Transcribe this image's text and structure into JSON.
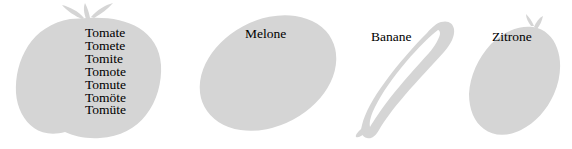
{
  "page": {
    "background_color": "#ffffff",
    "shape_fill_color": "#d5d5d5",
    "text_color": "#000000"
  },
  "figure": {
    "items": [
      {
        "id": "tomato",
        "icon": "tomato-shape",
        "label": "Tomate",
        "word_list": [
          "Tomate",
          "Tomete",
          "Tomite",
          "Tomote",
          "Tomute",
          "Tomöte",
          "Tomüte"
        ]
      },
      {
        "id": "melon",
        "icon": "melon-shape",
        "label": "Melone"
      },
      {
        "id": "banana",
        "icon": "banana-shape",
        "label": "Banane"
      },
      {
        "id": "lemon",
        "icon": "lemon-shape",
        "label": "Zitrone"
      }
    ]
  }
}
